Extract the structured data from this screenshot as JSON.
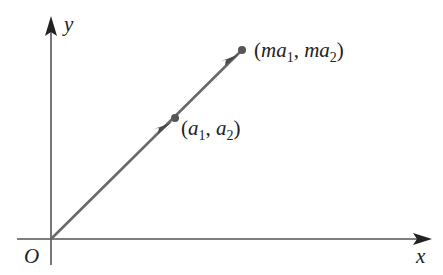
{
  "figure": {
    "type": "vector-scalar-multiple-diagram",
    "axes": {
      "x_label": "x",
      "y_label": "y",
      "origin_label": "O",
      "axis_color": "#555555"
    },
    "vector": {
      "color": "#6a6a6a",
      "arrowhead_color": "#4a4a4a",
      "from": "O",
      "through_point": {
        "label_open": "(",
        "label_a1": "a",
        "label_a1_sub": "1",
        "label_sep": ", ",
        "label_a2": "a",
        "label_a2_sub": "2",
        "label_close": ")"
      },
      "end_point": {
        "label_open": "(",
        "label_ma1": "ma",
        "label_ma1_sub": "1",
        "label_sep": ", ",
        "label_ma2": "ma",
        "label_ma2_sub": "2",
        "label_close": ")"
      },
      "point_color": "#555555"
    }
  }
}
